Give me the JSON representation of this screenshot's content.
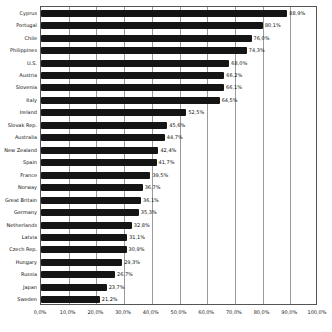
{
  "chart_data": {
    "type": "bar",
    "orientation": "horizontal",
    "title": "",
    "xlabel": "",
    "ylabel": "",
    "xlim": [
      0,
      100
    ],
    "grid": true,
    "legend": "none",
    "bar_color": "#151515",
    "grid_color": "#9a9a9a",
    "axis_color": "#555555",
    "background_color": "#ffffff",
    "categories": [
      "Cyprus",
      "Portugal",
      "Chile",
      "Philippines",
      "U.S.",
      "Austria",
      "Slovenia",
      "Italy",
      "Ireland",
      "Slovak Rep.",
      "Australia",
      "New Zealand",
      "Spain",
      "France",
      "Norway",
      "Great Britain",
      "Germany",
      "Netherlands",
      "Latvia",
      "Czech Rep.",
      "Hungary",
      "Russia",
      "Japan",
      "Sweden"
    ],
    "values": [
      88.9,
      80.1,
      76.0,
      74.3,
      68.0,
      66.2,
      66.1,
      64.5,
      52.5,
      45.6,
      44.7,
      42.4,
      41.7,
      39.5,
      36.7,
      36.1,
      35.3,
      32.8,
      31.1,
      30.9,
      29.3,
      26.7,
      23.7,
      21.2
    ],
    "value_labels": [
      "88,9%",
      "80,1%",
      "76,0%",
      "74,3%",
      "68,0%",
      "66,2%",
      "66,1%",
      "64,5%",
      "52,5%",
      "45,6%",
      "44,7%",
      "42,4%",
      "41,7%",
      "39,5%",
      "36,7%",
      "36,1%",
      "35,3%",
      "32,8%",
      "31,1%",
      "30,9%",
      "29,3%",
      "26,7%",
      "23,7%",
      "21,2%"
    ],
    "x_ticks": [
      "0,0%",
      "10,0%",
      "20,0%",
      "30,0%",
      "40,0%",
      "50,0%",
      "60,0%",
      "70,0%",
      "80,0%",
      "90,0%",
      "100,0%"
    ]
  }
}
